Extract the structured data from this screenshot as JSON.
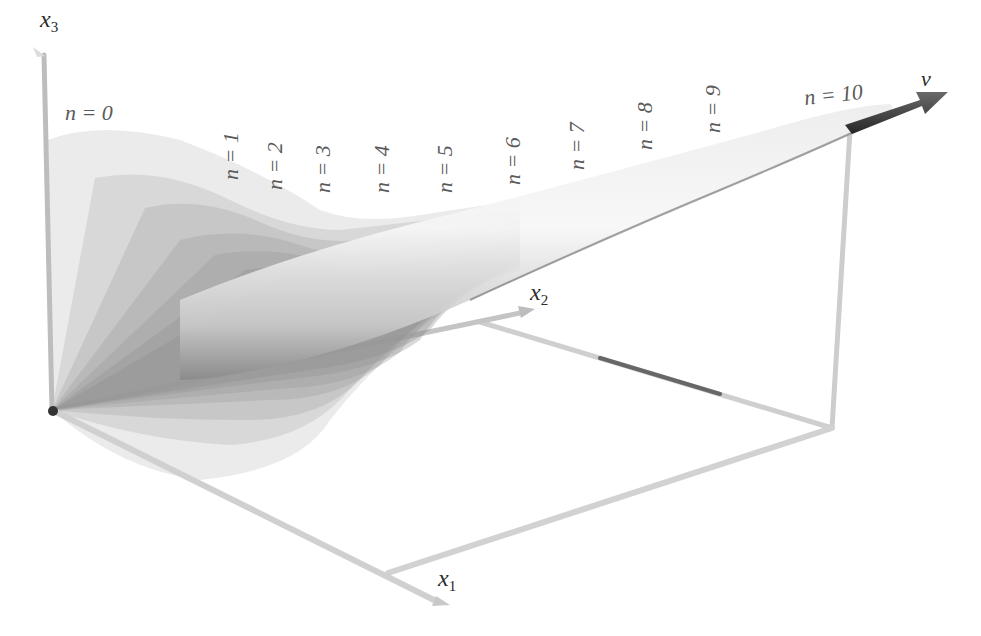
{
  "figure": {
    "axes": {
      "x1": {
        "label": "x",
        "sub": "1"
      },
      "x2": {
        "label": "x",
        "sub": "2"
      },
      "x3": {
        "label": "x",
        "sub": "3"
      }
    },
    "vector_label": "v",
    "cone_labels": [
      {
        "text": "n = 0",
        "orientation": "horizontal"
      },
      {
        "text": "n = 1",
        "orientation": "vertical"
      },
      {
        "text": "n = 2",
        "orientation": "vertical"
      },
      {
        "text": "n = 3",
        "orientation": "vertical"
      },
      {
        "text": "n = 4",
        "orientation": "vertical"
      },
      {
        "text": "n = 5",
        "orientation": "vertical"
      },
      {
        "text": "n = 6",
        "orientation": "vertical"
      },
      {
        "text": "n = 7",
        "orientation": "vertical"
      },
      {
        "text": "n = 8",
        "orientation": "vertical"
      },
      {
        "text": "n = 9",
        "orientation": "vertical"
      },
      {
        "text": "n = 10",
        "orientation": "horizontal"
      }
    ],
    "colors": {
      "axis": "#c8c8c8",
      "cone_fill": "#9a9a9a",
      "vector": "#3c3c3c",
      "origin": "#333333",
      "text": "#555555"
    }
  }
}
